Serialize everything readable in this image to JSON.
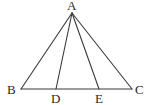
{
  "diagram": {
    "type": "geometry-triangle",
    "points": {
      "A": {
        "label": "A",
        "x": 72,
        "y": 13
      },
      "B": {
        "label": "B",
        "x": 21,
        "y": 89
      },
      "C": {
        "label": "C",
        "x": 132,
        "y": 89
      },
      "D": {
        "label": "D",
        "x": 56,
        "y": 89
      },
      "E": {
        "label": "E",
        "x": 99,
        "y": 89
      }
    },
    "segments": [
      "AB",
      "AC",
      "BC",
      "AD",
      "AE"
    ],
    "labels": {
      "A": "A",
      "B": "B",
      "C": "C",
      "D": "D",
      "E": "E"
    },
    "stroke_color": "#3a3a3a",
    "label_color": "#2a2a2a"
  }
}
